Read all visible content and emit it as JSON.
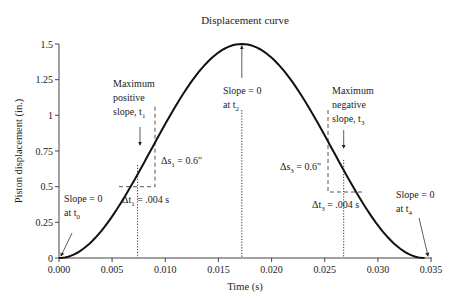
{
  "chart_data": {
    "type": "line",
    "title": "Displacement curve",
    "xlabel": "Time (s)",
    "ylabel": "Piston displacement (in.)",
    "xlim": [
      0,
      0.035
    ],
    "ylim": [
      0,
      1.5
    ],
    "xticks": [
      "0.000",
      "0.005",
      "0.010",
      "0.015",
      "0.020",
      "0.025",
      "0.030",
      "0.035"
    ],
    "yticks": [
      "0",
      "0.25",
      "0.5",
      "0.75",
      "1",
      "1.25",
      "1.5"
    ],
    "grid": false,
    "legend": null,
    "series": [
      {
        "name": "Displacement",
        "x": [
          0.0,
          0.002,
          0.004,
          0.006,
          0.0074,
          0.008,
          0.01,
          0.012,
          0.014,
          0.0172,
          0.02,
          0.022,
          0.024,
          0.026,
          0.0268,
          0.028,
          0.03,
          0.032,
          0.0344
        ],
        "y": [
          0.0,
          0.05,
          0.19,
          0.42,
          0.6,
          0.69,
          0.95,
          1.19,
          1.38,
          1.5,
          1.4,
          1.23,
          1.0,
          0.74,
          0.64,
          0.49,
          0.24,
          0.07,
          0.0
        ]
      }
    ],
    "annotations": [
      {
        "id": "t0",
        "lines": [
          "Slope = 0",
          "at t0"
        ],
        "x": 0.0,
        "y": 0.0
      },
      {
        "id": "t1",
        "lines": [
          "Maximum",
          "positive",
          "slope, t1"
        ],
        "x": 0.0074,
        "y": 0.6
      },
      {
        "id": "t2",
        "lines": [
          "Slope = 0",
          "at t2"
        ],
        "x": 0.0172,
        "y": 1.5
      },
      {
        "id": "t3",
        "lines": [
          "Maximum",
          "negative",
          "slope, t3"
        ],
        "x": 0.0268,
        "y": 0.64
      },
      {
        "id": "t4",
        "lines": [
          "Slope = 0",
          "at t4"
        ],
        "x": 0.0344,
        "y": 0.0
      },
      {
        "id": "ds1",
        "text": "Δs1 = 0.6\""
      },
      {
        "id": "dt1",
        "text": "Δt1 = .004 s"
      },
      {
        "id": "ds3",
        "text": "Δs3 = 0.6\""
      },
      {
        "id": "dt3",
        "text": "Δt3 = .004 s"
      }
    ]
  },
  "labels": {
    "title": "Displacement curve",
    "xlabel": "Time (s)",
    "ylabel": "Piston displacement (in.)",
    "xticks": [
      "0.000",
      "0.005",
      "0.010",
      "0.015",
      "0.020",
      "0.025",
      "0.030",
      "0.035"
    ],
    "yticks": [
      "0",
      "0.25",
      "0.5",
      "0.75",
      "1",
      "1.25",
      "1.5"
    ],
    "t0": {
      "l1": "Slope = 0",
      "l2a": "at t",
      "sub": "0"
    },
    "t1": {
      "l1": "Maximum",
      "l2": "positive",
      "l3a": "slope, t",
      "sub": "1"
    },
    "t2": {
      "l1": "Slope = 0",
      "l2a": "at t",
      "sub": "2"
    },
    "t3": {
      "l1": "Maximum",
      "l2": "negative",
      "l3a": "slope, t",
      "sub": "3"
    },
    "t4": {
      "l1": "Slope = 0",
      "l2a": "at t",
      "sub": "4"
    },
    "ds1": {
      "a": "Δs",
      "sub": "1",
      "b": " = 0.6\""
    },
    "dt1": {
      "a": "Δt",
      "sub": "1",
      "b": " = .004 s"
    },
    "ds3": {
      "a": "Δs",
      "sub": "3",
      "b": " = 0.6\""
    },
    "dt3": {
      "a": "Δt",
      "sub": "3",
      "b": " = .004 s"
    }
  },
  "colors": {
    "curve": "#111111",
    "axis": "#444444",
    "text": "#222222"
  }
}
